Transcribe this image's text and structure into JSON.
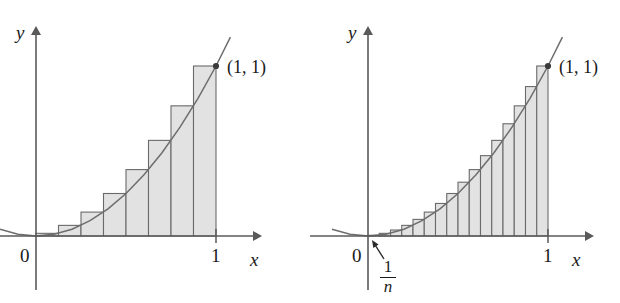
{
  "figure": {
    "background_color": "#ffffff",
    "bar_fill_color": "#e2e2e2",
    "bar_stroke_color": "#6a6a6a",
    "axis_color": "#5a5a5a",
    "curve_color": "#6d6d6d"
  },
  "panels": [
    {
      "id": "left-panel",
      "name": "riemann-sum-8-rectangles",
      "labels": {
        "y_axis": "y",
        "x_axis": "x",
        "origin": "0",
        "x_tick": "1",
        "point": "(1, 1)"
      },
      "geometry": {
        "origin_px": [
          36,
          236
        ],
        "x_one_px": 216,
        "y_one_px": 66,
        "x_axis_arrow_px": [
          262,
          236
        ],
        "y_axis_arrow_px": [
          36,
          26
        ]
      },
      "chart_data": {
        "type": "bar",
        "title": "Right-endpoint Riemann sum with n = 8",
        "function": "y = x^2",
        "xlabel": "x",
        "ylabel": "y",
        "n": 8,
        "xlim": [
          0,
          1
        ],
        "ylim": [
          0,
          1
        ],
        "grid": false,
        "legend": false,
        "categories": [
          "0.125",
          "0.250",
          "0.375",
          "0.500",
          "0.625",
          "0.750",
          "0.875",
          "1.000"
        ],
        "bar_left_edges": [
          0,
          0.125,
          0.25,
          0.375,
          0.5,
          0.625,
          0.75,
          0.875
        ],
        "bar_right_edges": [
          0.125,
          0.25,
          0.375,
          0.5,
          0.625,
          0.75,
          0.875,
          1
        ],
        "values": [
          0.015625,
          0.0625,
          0.140625,
          0.25,
          0.390625,
          0.5625,
          0.765625,
          1
        ],
        "curve_points_x": [
          -0.2,
          -0.1,
          0,
          0.1,
          0.2,
          0.3,
          0.4,
          0.5,
          0.6,
          0.7,
          0.8,
          0.9,
          1.0,
          1.08
        ],
        "curve_points_y": [
          0.04,
          0.01,
          0,
          0.01,
          0.04,
          0.09,
          0.16,
          0.25,
          0.36,
          0.49,
          0.64,
          0.81,
          1.0,
          1.17
        ],
        "marked_points": [
          {
            "label": "(1, 1)",
            "x": 1,
            "y": 1
          }
        ]
      }
    },
    {
      "id": "right-panel",
      "name": "riemann-sum-16-rectangles",
      "labels": {
        "y_axis": "y",
        "x_axis": "x",
        "origin": "0",
        "x_tick": "1",
        "point": "(1, 1)",
        "width_numerator": "1",
        "width_denominator": "n",
        "width_annotation": "1/n"
      },
      "geometry": {
        "origin_px": [
          368,
          236
        ],
        "x_one_px": 548,
        "y_one_px": 66,
        "x_axis_arrow_px": [
          594,
          236
        ],
        "y_axis_arrow_px": [
          368,
          26
        ],
        "pointer_from_px": [
          384,
          259
        ],
        "pointer_to_px": [
          372,
          240
        ]
      },
      "chart_data": {
        "type": "bar",
        "title": "Right-endpoint Riemann sum with n = 16",
        "function": "y = x^2",
        "xlabel": "x",
        "ylabel": "y",
        "n": 16,
        "xlim": [
          0,
          1
        ],
        "ylim": [
          0,
          1
        ],
        "grid": false,
        "legend": false,
        "categories": [
          "0.0625",
          "0.1250",
          "0.1875",
          "0.2500",
          "0.3125",
          "0.3750",
          "0.4375",
          "0.5000",
          "0.5625",
          "0.6250",
          "0.6875",
          "0.7500",
          "0.8125",
          "0.8750",
          "0.9375",
          "1.0000"
        ],
        "bar_left_edges": [
          0,
          0.0625,
          0.125,
          0.1875,
          0.25,
          0.3125,
          0.375,
          0.4375,
          0.5,
          0.5625,
          0.625,
          0.6875,
          0.75,
          0.8125,
          0.875,
          0.9375
        ],
        "bar_right_edges": [
          0.0625,
          0.125,
          0.1875,
          0.25,
          0.3125,
          0.375,
          0.4375,
          0.5,
          0.5625,
          0.625,
          0.6875,
          0.75,
          0.8125,
          0.875,
          0.9375,
          1
        ],
        "values": [
          0.00390625,
          0.015625,
          0.03515625,
          0.0625,
          0.09765625,
          0.140625,
          0.19140625,
          0.25,
          0.31640625,
          0.390625,
          0.47265625,
          0.5625,
          0.66015625,
          0.765625,
          0.87890625,
          1
        ],
        "curve_points_x": [
          -0.2,
          -0.1,
          0,
          0.1,
          0.2,
          0.3,
          0.4,
          0.5,
          0.6,
          0.7,
          0.8,
          0.9,
          1.0,
          1.08
        ],
        "curve_points_y": [
          0.04,
          0.01,
          0,
          0.01,
          0.04,
          0.09,
          0.16,
          0.25,
          0.36,
          0.49,
          0.64,
          0.81,
          1.0,
          1.17
        ],
        "marked_points": [
          {
            "label": "(1, 1)",
            "x": 1,
            "y": 1
          }
        ],
        "annotations": [
          {
            "label": "1/n",
            "describes": "width of each subinterval"
          }
        ]
      }
    }
  ]
}
